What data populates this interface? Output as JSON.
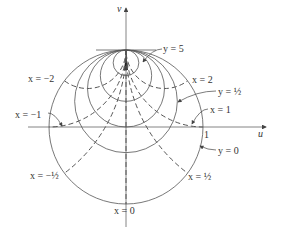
{
  "figure": {
    "axes": {
      "horizontal_label": "u",
      "vertical_label": "v",
      "unit_tick_label": "1"
    },
    "origin_px": [
      126,
      127
    ],
    "unit_radius_px": 77,
    "line_color": "#555555",
    "y_circles": [
      {
        "value": 0,
        "label": "y = 0"
      },
      {
        "value": 0.5,
        "label": "y = ½"
      },
      {
        "value": 1
      },
      {
        "value": 2
      },
      {
        "value": 5,
        "label": "y = 5"
      }
    ],
    "x_curves": [
      {
        "value": -2,
        "label": "x = −2"
      },
      {
        "value": -1,
        "label": "x = −1"
      },
      {
        "value": -0.5,
        "label": "x = −½"
      },
      {
        "value": 0,
        "label": "x = 0"
      },
      {
        "value": 0.5,
        "label": "x = ½"
      },
      {
        "value": 1,
        "label": "x = 1"
      },
      {
        "value": 2,
        "label": "x = 2"
      }
    ]
  },
  "labels": {
    "v": "v",
    "u": "u",
    "one": "1",
    "y5": "y = 5",
    "x2": "x = 2",
    "yhalf": "y = ½",
    "x1": "x = 1",
    "y0": "y = 0",
    "xhalf": "x = ½",
    "x0": "x = 0",
    "xmhalf": "x = −½",
    "xm1": "x = −1",
    "xm2": "x = −2"
  }
}
